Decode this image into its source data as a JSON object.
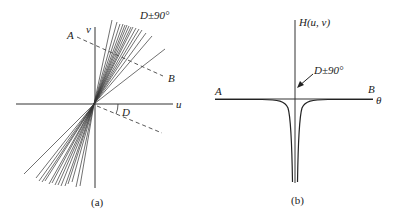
{
  "panel_a": {
    "caption": "(a)",
    "axis_u_label": "u",
    "axis_v_label": "v",
    "point_a_label": "A",
    "point_b_label": "B",
    "angle_label": "D",
    "annotation": "D±90°",
    "origin": [
      94,
      104
    ],
    "line_color": "#333333",
    "dashed_color": "#444444",
    "fan_lines_upper": [
      [
        112,
        20
      ],
      [
        117,
        22
      ],
      [
        120,
        24
      ],
      [
        123,
        24
      ],
      [
        125,
        25
      ],
      [
        127,
        25
      ],
      [
        129,
        26
      ],
      [
        131,
        27
      ],
      [
        133,
        27
      ],
      [
        136,
        28
      ],
      [
        139,
        29
      ],
      [
        142,
        30
      ],
      [
        146,
        33
      ],
      [
        152,
        36
      ],
      [
        165,
        49
      ]
    ],
    "fan_lines_lower": [
      [
        39,
        181
      ],
      [
        42,
        182
      ],
      [
        45,
        181
      ],
      [
        49,
        184
      ],
      [
        52,
        183
      ],
      [
        55,
        185
      ],
      [
        58,
        185
      ],
      [
        61,
        186
      ],
      [
        65,
        186
      ],
      [
        68,
        184
      ],
      [
        72,
        182
      ],
      [
        76,
        187
      ],
      [
        80,
        186
      ],
      [
        24,
        174
      ],
      [
        36,
        178
      ]
    ],
    "dashed_ab": [
      [
        77,
        37
      ],
      [
        163,
        76
      ]
    ],
    "dashed_d": [
      [
        97,
        106
      ],
      [
        162,
        133
      ]
    ]
  },
  "panel_b": {
    "caption": "(b)",
    "axis_theta_label": "θ",
    "axis_h_label": "H(u, v)",
    "point_a_label": "A",
    "point_b_label": "B",
    "annotation": "D±90°",
    "origin": [
      295,
      99
    ],
    "curve_color": "#222222"
  }
}
